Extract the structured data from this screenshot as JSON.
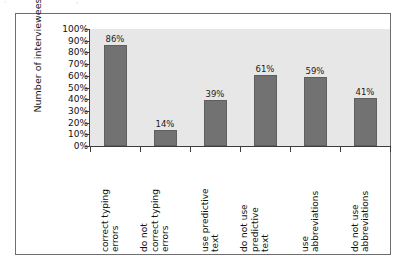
{
  "figure": {
    "artifacts": [
      "‘",
      "’"
    ]
  },
  "chart_data": {
    "type": "bar",
    "title": "",
    "xlabel": "",
    "ylabel": "Number of interviewees",
    "ylim": [
      0,
      100
    ],
    "grid": false,
    "legend": "none",
    "y_ticks": [
      "0%",
      "10%",
      "20%",
      "30%",
      "40%",
      "50%",
      "60%",
      "70%",
      "80%",
      "90%",
      "100%"
    ],
    "categories": [
      "correct typing errors",
      "do not correct typing errors",
      "use predictive text",
      "do not use predictive text",
      "use abbreviations",
      "do not use abbreviations"
    ],
    "category_lines": [
      [
        "correct typing",
        "errors"
      ],
      [
        "do not",
        "correct typing",
        "errors"
      ],
      [
        "use predictive",
        "text"
      ],
      [
        "do not use",
        "predictive",
        "text"
      ],
      [
        "use",
        "abbreviations"
      ],
      [
        "do not use",
        "abbreviations"
      ]
    ],
    "values": [
      86,
      14,
      39,
      61,
      59,
      41
    ],
    "value_labels": [
      "86%",
      "14%",
      "39%",
      "61%",
      "59%",
      "41%"
    ],
    "colors": {
      "bar": "#727272",
      "bar_border": "#5f5f5f",
      "plot_background": "#e7e7e7",
      "axis": "#3c3c3c",
      "frame": "#6e6e6e",
      "text": "#111111"
    }
  }
}
